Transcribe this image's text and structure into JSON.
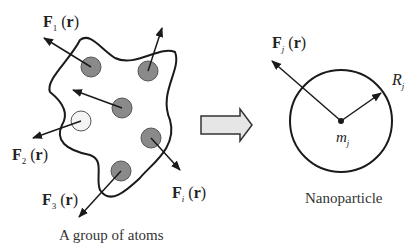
{
  "left_panel": {
    "caption": "A group of atoms",
    "forces": [
      {
        "name": "F",
        "sub": "1",
        "arg": "r"
      },
      {
        "name": "F",
        "sub": "2",
        "arg": "r"
      },
      {
        "name": "F",
        "sub": "3",
        "arg": "r"
      },
      {
        "name": "F",
        "sub": "i",
        "arg": "r"
      }
    ]
  },
  "right_panel": {
    "caption": "Nanoparticle",
    "force": {
      "name": "F",
      "sub": "j",
      "arg": "r"
    },
    "radius": {
      "name": "R",
      "sub": "j"
    },
    "mass": {
      "name": "m",
      "sub": "j"
    }
  },
  "colors": {
    "atom_fill": "#8a8a8a",
    "empty_atom_fill": "#f4f4f4",
    "arrow_fill": "#e6e6e6",
    "stroke": "#1a1a1a"
  }
}
